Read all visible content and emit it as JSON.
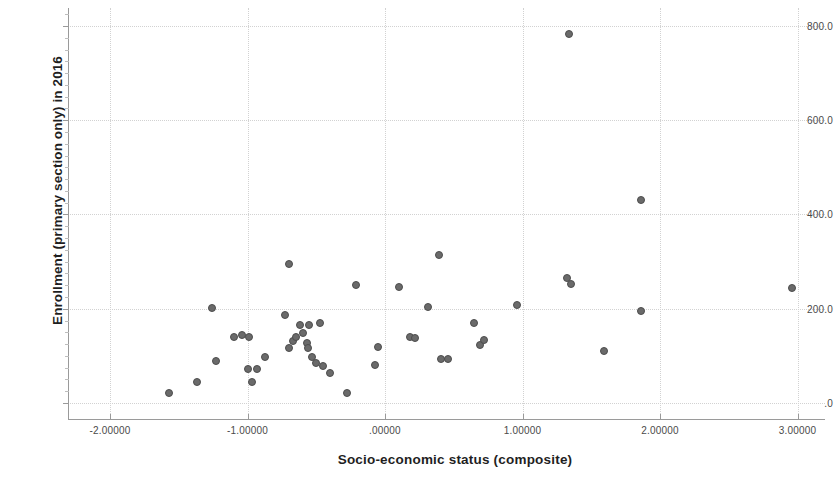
{
  "chart_data": {
    "type": "scatter",
    "title": "",
    "xlabel": "Socio-economic status (composite)",
    "ylabel": "Enrollment (primary section only) in 2016",
    "xlim": [
      -2.35,
      3.3
    ],
    "ylim": [
      -18,
      836
    ],
    "xticks": [
      -2,
      -1,
      0,
      1,
      2,
      3
    ],
    "xtick_labels": [
      "-2.00000",
      "-1.00000",
      ".00000",
      "1.00000",
      "2.00000",
      "3.00000"
    ],
    "yticks": [
      0,
      200,
      400,
      600,
      800
    ],
    "ytick_labels": [
      ".0",
      "200.0",
      "400.0",
      "600.0",
      "800.0"
    ],
    "grid": true,
    "legend": false,
    "marker_color": "#6a6a6a",
    "marker_edge_color": "#4d4d4d",
    "points": [
      {
        "x": -1.57,
        "y": 21
      },
      {
        "x": -1.37,
        "y": 45
      },
      {
        "x": -1.26,
        "y": 201
      },
      {
        "x": -1.23,
        "y": 89
      },
      {
        "x": -1.1,
        "y": 141
      },
      {
        "x": -1.04,
        "y": 144
      },
      {
        "x": -1.0,
        "y": 72
      },
      {
        "x": -0.99,
        "y": 140
      },
      {
        "x": -0.97,
        "y": 45
      },
      {
        "x": -0.93,
        "y": 72
      },
      {
        "x": -0.87,
        "y": 98
      },
      {
        "x": -0.7,
        "y": 295
      },
      {
        "x": -0.73,
        "y": 187
      },
      {
        "x": -0.7,
        "y": 117
      },
      {
        "x": -0.67,
        "y": 131
      },
      {
        "x": -0.65,
        "y": 140
      },
      {
        "x": -0.62,
        "y": 165
      },
      {
        "x": -0.6,
        "y": 148
      },
      {
        "x": -0.57,
        "y": 127
      },
      {
        "x": -0.56,
        "y": 117
      },
      {
        "x": -0.55,
        "y": 165
      },
      {
        "x": -0.53,
        "y": 98
      },
      {
        "x": -0.5,
        "y": 85
      },
      {
        "x": -0.47,
        "y": 170
      },
      {
        "x": -0.45,
        "y": 78
      },
      {
        "x": -0.4,
        "y": 64
      },
      {
        "x": -0.28,
        "y": 21
      },
      {
        "x": -0.21,
        "y": 250
      },
      {
        "x": -0.07,
        "y": 80
      },
      {
        "x": -0.05,
        "y": 119
      },
      {
        "x": 0.1,
        "y": 246
      },
      {
        "x": 0.18,
        "y": 141
      },
      {
        "x": 0.22,
        "y": 138
      },
      {
        "x": 0.31,
        "y": 204
      },
      {
        "x": 0.39,
        "y": 315
      },
      {
        "x": 0.41,
        "y": 94
      },
      {
        "x": 0.46,
        "y": 93
      },
      {
        "x": 0.65,
        "y": 170
      },
      {
        "x": 0.69,
        "y": 124
      },
      {
        "x": 0.72,
        "y": 134
      },
      {
        "x": 0.96,
        "y": 208
      },
      {
        "x": 1.34,
        "y": 783
      },
      {
        "x": 1.32,
        "y": 265
      },
      {
        "x": 1.35,
        "y": 253
      },
      {
        "x": 1.59,
        "y": 110
      },
      {
        "x": 1.86,
        "y": 431
      },
      {
        "x": 1.86,
        "y": 195
      },
      {
        "x": 2.96,
        "y": 244
      }
    ]
  },
  "axis": {
    "y_title": "Enrollment (primary section only) in 2016",
    "x_title": "Socio-economic status (composite)"
  }
}
